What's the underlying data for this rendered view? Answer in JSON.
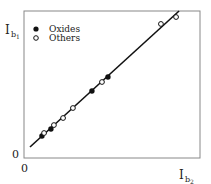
{
  "chart_data": {
    "type": "scatter",
    "title": "",
    "xlabel": "I_b2",
    "ylabel": "I_b1",
    "xlim": [
      0,
      100
    ],
    "ylim": [
      0,
      100
    ],
    "x_ticks": [
      "0"
    ],
    "y_ticks": [
      "0"
    ],
    "grid": false,
    "legend_position": "upper left",
    "series": [
      {
        "name": "Oxides",
        "marker": "filled-circle",
        "points": [
          [
            10.2,
            15.0
          ],
          [
            15.3,
            19.7
          ],
          [
            38.6,
            45.6
          ],
          [
            47.7,
            55.1
          ]
        ]
      },
      {
        "name": "Others",
        "marker": "open-circle",
        "points": [
          [
            11.4,
            17.0
          ],
          [
            17.0,
            22.4
          ],
          [
            22.2,
            27.2
          ],
          [
            27.8,
            34.0
          ],
          [
            44.3,
            51.7
          ],
          [
            77.8,
            91.2
          ],
          [
            86.4,
            95.9
          ]
        ]
      }
    ],
    "fit_line": {
      "from": [
        3.4,
        7.5
      ],
      "to": [
        88.1,
        100
      ]
    }
  },
  "labels": {
    "y_axis_main": "I",
    "y_axis_sub": "b",
    "y_axis_subsub": "1",
    "x_axis_main": "I",
    "x_axis_sub": "b",
    "x_axis_subsub": "2",
    "y_zero": "0",
    "x_zero": "0",
    "legend_oxides": "Oxides",
    "legend_others": "Others"
  }
}
